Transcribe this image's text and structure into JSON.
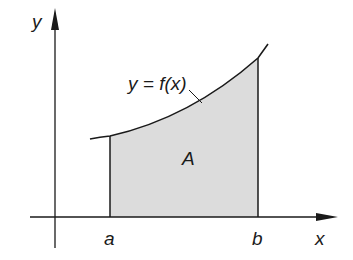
{
  "figure": {
    "type": "area-under-curve",
    "labels": {
      "y_axis": "y",
      "x_axis": "x",
      "curve": "y = f(x)",
      "area": "A",
      "lower_bound": "a",
      "upper_bound": "b"
    },
    "colors": {
      "line": "#1a1a1a",
      "fill": "#dcdcdc",
      "background": "#ffffff"
    }
  }
}
